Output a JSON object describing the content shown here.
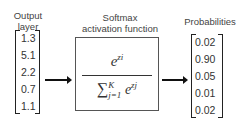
{
  "labels": {
    "input": [
      "Output",
      "layer"
    ],
    "function": [
      "Softmax",
      "activation function"
    ],
    "output": [
      "Probabilities"
    ]
  },
  "input_vector": [
    "1.3",
    "5.1",
    "2.2",
    "0.7",
    "1.1"
  ],
  "output_vector": [
    "0.02",
    "0.90",
    "0.05",
    "0.01",
    "0.02"
  ],
  "formula": {
    "numerator": "e",
    "numerator_sup": "zi",
    "denominator_sum": "∑",
    "sum_upper": "K",
    "sum_lower": "j=1",
    "denominator_term": "e",
    "denominator_sup": "zj"
  }
}
